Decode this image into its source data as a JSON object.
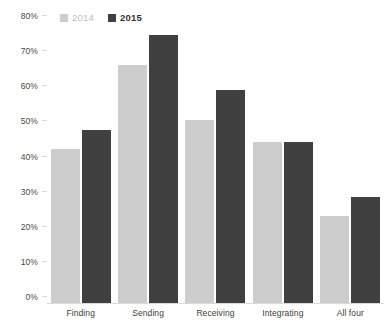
{
  "chart_data": {
    "type": "bar",
    "title": "",
    "xlabel": "",
    "ylabel": "",
    "categories": [
      "Finding",
      "Sending",
      "Receiving",
      "Integrating",
      "All four"
    ],
    "series": [
      {
        "name": "2014",
        "color": "#cdcdcd",
        "values": [
          44,
          68,
          52.5,
          46,
          25
        ]
      },
      {
        "name": "2015",
        "color": "#404040",
        "values": [
          49.5,
          76.5,
          61,
          46,
          30.5
        ]
      }
    ],
    "ylim": [
      0,
      80
    ],
    "y_tick_values": [
      0,
      10,
      20,
      30,
      40,
      50,
      60,
      70,
      80
    ],
    "y_tick_labels": [
      "0%",
      "10%",
      "20%",
      "30%",
      "40%",
      "50%",
      "60%",
      "70%",
      "80%"
    ],
    "grid": false,
    "legend_position": "top-left",
    "value_format": "percent"
  },
  "legend": {
    "entries": [
      {
        "label": "2014",
        "color": "#cdcdcd"
      },
      {
        "label": "2015",
        "color": "#404040"
      }
    ]
  },
  "axis": {
    "baseline_color": "#d9d9d9",
    "tick_color": "#d9d9d9"
  }
}
